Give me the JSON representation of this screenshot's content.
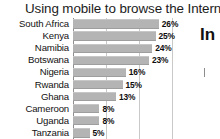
{
  "chart_data": {
    "type": "bar",
    "orientation": "horizontal",
    "title": "Using mobile to browse the Internet",
    "xlabel": "",
    "ylabel": "",
    "categories": [
      "South Africa",
      "Kenya",
      "Namibia",
      "Botswana",
      "Nigeria",
      "Rwanda",
      "Ghana",
      "Cameroon",
      "Uganda",
      "Tanzania"
    ],
    "values": [
      26,
      25,
      24,
      23,
      16,
      15,
      13,
      8,
      8,
      5
    ],
    "value_labels": [
      "26%",
      "25%",
      "24%",
      "23%",
      "16%",
      "15%",
      "13%",
      "8%",
      "8%",
      "5%"
    ],
    "xlim": [
      0,
      30
    ],
    "grid": true,
    "gridlines": [
      0,
      10,
      20,
      30
    ],
    "legend": "none",
    "bar_color": "#b4b4b4"
  },
  "side_panel": {
    "fragment_text": "In"
  }
}
